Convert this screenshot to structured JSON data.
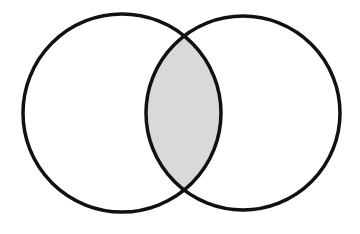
{
  "diagram": {
    "type": "venn",
    "sets": [
      {
        "id": "A",
        "label": "",
        "cx": 122,
        "cy": 113,
        "r": 99
      },
      {
        "id": "B",
        "label": "",
        "cx": 243,
        "cy": 113,
        "r": 97
      }
    ],
    "highlighted_region": "A∩B",
    "colors": {
      "background": "#ffffff",
      "stroke": "#111111",
      "intersection_fill": "#d9d9d9"
    },
    "stroke_width": 3.5
  }
}
